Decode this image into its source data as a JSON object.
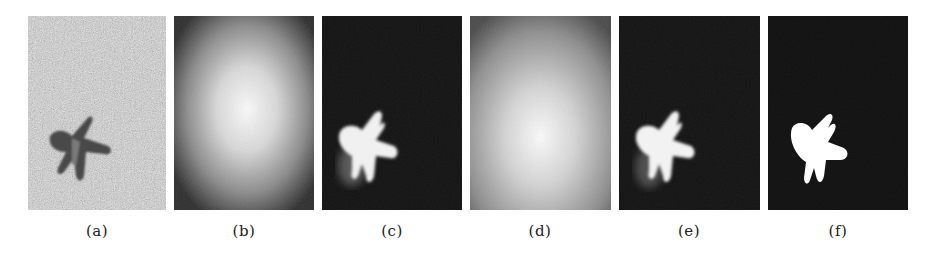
{
  "figure": {
    "panels": [
      {
        "id": "a",
        "label": "(a)",
        "content": "input grayscale image of a starfish on sand"
      },
      {
        "id": "b",
        "label": "(b)",
        "content": "center-bias prior map (bright centre, dark corners)"
      },
      {
        "id": "c",
        "label": "(c)",
        "content": "saliency map with bright starfish region"
      },
      {
        "id": "d",
        "label": "(d)",
        "content": "prior map centred lower near object"
      },
      {
        "id": "e",
        "label": "(e)",
        "content": "refined saliency map"
      },
      {
        "id": "f",
        "label": "(f)",
        "content": "ground-truth binary mask"
      }
    ]
  }
}
